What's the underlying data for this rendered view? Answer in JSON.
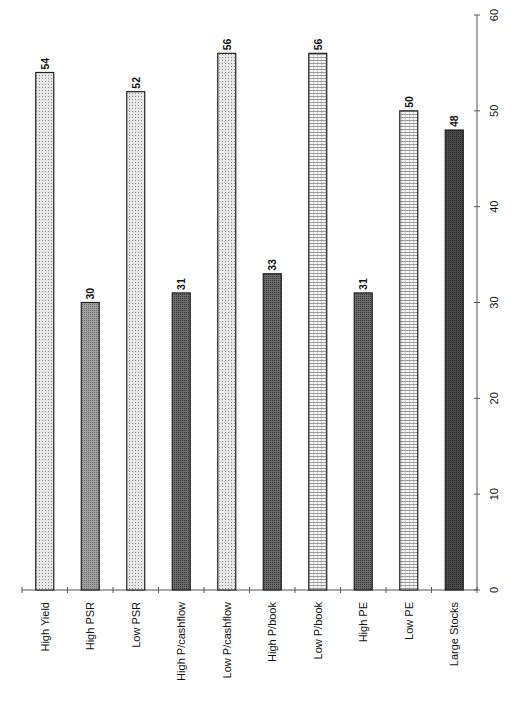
{
  "chart_data": {
    "type": "bar",
    "orientation": "vertical (page rotated 90°; labels read bottom-to-top)",
    "title": "",
    "xlabel": "",
    "ylabel": "",
    "categories": [
      "High Yield",
      "High PSR",
      "Low PSR",
      "High P/cashflow",
      "Low P/cashflow",
      "High P/book",
      "Low P/book",
      "High PE",
      "Low PE",
      "Large Stocks"
    ],
    "values": [
      54,
      30,
      52,
      31,
      56,
      33,
      56,
      31,
      50,
      48
    ],
    "data_labels": [
      "54",
      "30",
      "52",
      "31",
      "56",
      "33",
      "56",
      "31",
      "50",
      "48"
    ],
    "ylim": [
      0,
      60
    ],
    "yticks": [
      0,
      10,
      20,
      30,
      40,
      50,
      60
    ],
    "ytick_labels": [
      "0",
      "10",
      "20",
      "30",
      "40",
      "50",
      "60"
    ],
    "grid": false,
    "legend": null,
    "bar_fills": [
      "dotted-light",
      "medium-gray",
      "dotted-light",
      "dark-gray",
      "dotted-light",
      "dark-gray",
      "horizontal-lines-light",
      "dark-gray",
      "horizontal-lines-light",
      "very-dark-gray"
    ],
    "colors": {
      "dotted-light": "#cfcfcf",
      "medium-gray": "#8a8a8a",
      "dark-gray": "#5a5a5a",
      "horizontal-lines-light": "#e4e4e4",
      "very-dark-gray": "#3a3a3a"
    }
  }
}
